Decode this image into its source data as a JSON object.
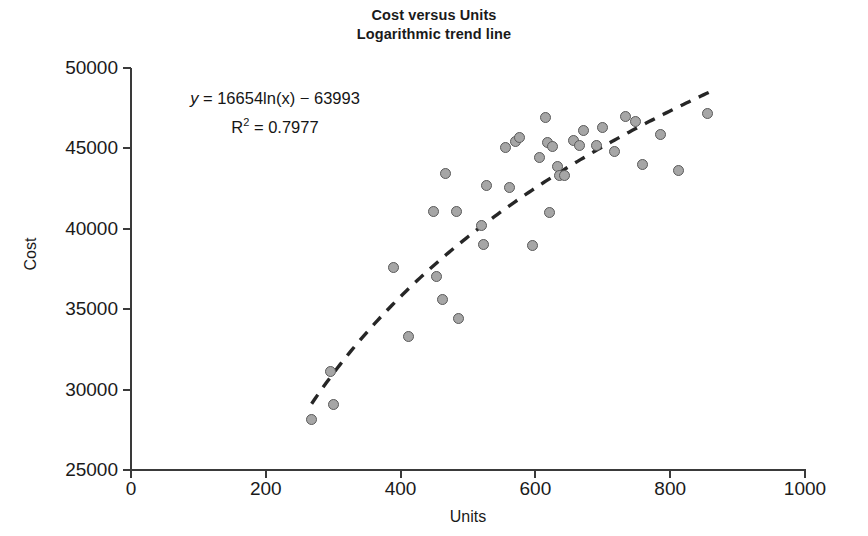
{
  "chart_data": {
    "type": "scatter",
    "title": "Cost versus Units",
    "subtitle": "Logarithmic trend line",
    "xlabel": "Units",
    "ylabel": "Cost",
    "xlim": [
      0,
      1000
    ],
    "ylim": [
      25000,
      50000
    ],
    "xticks": [
      0,
      200,
      400,
      600,
      800,
      1000
    ],
    "yticks": [
      25000,
      30000,
      35000,
      40000,
      45000,
      50000
    ],
    "grid": false,
    "legend": "none",
    "marker_fill": "#a6a6a6",
    "marker_edge": "#5a5a5a",
    "trendline_color": "#262626",
    "annotation": {
      "equation": "y = 16654ln(x) − 63993",
      "equation_prefix": "y",
      "equation_body": " = 16654ln(x) − 63993",
      "r_squared_label": "R",
      "r_squared_exponent": "2",
      "r_squared_value": " = 0.7977",
      "r_squared_full": "R² = 0.7977"
    },
    "trendline": {
      "type": "logarithmic",
      "slope": 16654,
      "intercept": -63993,
      "r2": 0.7977,
      "x_start": 268,
      "x_end": 862
    },
    "points": [
      {
        "x": 268,
        "y": 28150
      },
      {
        "x": 296,
        "y": 31100
      },
      {
        "x": 301,
        "y": 29100
      },
      {
        "x": 389,
        "y": 37600
      },
      {
        "x": 412,
        "y": 33300
      },
      {
        "x": 449,
        "y": 41050
      },
      {
        "x": 454,
        "y": 37050
      },
      {
        "x": 462,
        "y": 35600
      },
      {
        "x": 466,
        "y": 43450
      },
      {
        "x": 483,
        "y": 41050
      },
      {
        "x": 486,
        "y": 34450
      },
      {
        "x": 520,
        "y": 40200
      },
      {
        "x": 523,
        "y": 39050
      },
      {
        "x": 527,
        "y": 42700
      },
      {
        "x": 556,
        "y": 45050
      },
      {
        "x": 562,
        "y": 42550
      },
      {
        "x": 570,
        "y": 45450
      },
      {
        "x": 576,
        "y": 45650
      },
      {
        "x": 595,
        "y": 38950
      },
      {
        "x": 606,
        "y": 44450
      },
      {
        "x": 615,
        "y": 46950
      },
      {
        "x": 618,
        "y": 45350
      },
      {
        "x": 621,
        "y": 41000
      },
      {
        "x": 626,
        "y": 45100
      },
      {
        "x": 633,
        "y": 43850
      },
      {
        "x": 636,
        "y": 43300
      },
      {
        "x": 643,
        "y": 43300
      },
      {
        "x": 657,
        "y": 45500
      },
      {
        "x": 666,
        "y": 45150
      },
      {
        "x": 672,
        "y": 46100
      },
      {
        "x": 690,
        "y": 45150
      },
      {
        "x": 699,
        "y": 46300
      },
      {
        "x": 718,
        "y": 44800
      },
      {
        "x": 733,
        "y": 47000
      },
      {
        "x": 748,
        "y": 46700
      },
      {
        "x": 759,
        "y": 44000
      },
      {
        "x": 786,
        "y": 45850
      },
      {
        "x": 813,
        "y": 43650
      },
      {
        "x": 855,
        "y": 47200
      }
    ]
  }
}
